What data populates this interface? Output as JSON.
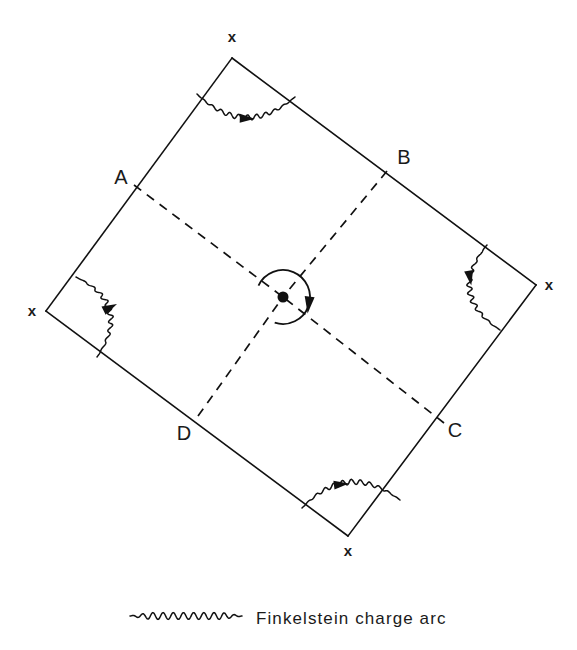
{
  "figure": {
    "background_color": "#ffffff",
    "line_color": "#111111"
  },
  "square": {
    "description": "Tilted square (diamond) with four vertices marked x",
    "vertices": [
      {
        "id": "top",
        "label": "x",
        "x": 232,
        "y": 58,
        "label_x": 232,
        "label_y": 42
      },
      {
        "id": "right",
        "label": "x",
        "x": 536,
        "y": 285,
        "label_x": 549,
        "label_y": 290
      },
      {
        "id": "bottom",
        "label": "x",
        "x": 348,
        "y": 536,
        "label_x": 348,
        "label_y": 556
      },
      {
        "id": "left",
        "label": "x",
        "x": 46,
        "y": 311,
        "label_x": 32,
        "label_y": 316
      }
    ]
  },
  "corner_points": [
    {
      "id": "A",
      "label": "A",
      "x": 134,
      "y": 185,
      "label_x": 121,
      "label_y": 184
    },
    {
      "id": "B",
      "label": "B",
      "x": 387,
      "y": 171,
      "label_x": 404,
      "label_y": 164
    },
    {
      "id": "C",
      "label": "C",
      "x": 444,
      "y": 423,
      "label_x": 455,
      "label_y": 437
    },
    {
      "id": "D",
      "label": "D",
      "x": 198,
      "y": 416,
      "label_x": 184,
      "label_y": 440
    }
  ],
  "center": {
    "id": "center-spin",
    "x": 283,
    "y": 297,
    "dot_radius": 5.5,
    "circle_radius": 27,
    "rotation": "clockwise",
    "arrow_direction": "down"
  },
  "charge_arcs": [
    {
      "id": "arc-top",
      "vertex": "top",
      "arrow_direction": "right"
    },
    {
      "id": "arc-right",
      "vertex": "right",
      "arrow_direction": "down"
    },
    {
      "id": "arc-bottom",
      "vertex": "bottom",
      "arrow_direction": "right"
    },
    {
      "id": "arc-left",
      "vertex": "left",
      "arrow_direction": "up-right"
    }
  ],
  "legend": {
    "sample_label": "wavy-line-sample",
    "text": "Finkelstein charge arc",
    "sample_x1": 130,
    "sample_x2": 242,
    "sample_y": 616,
    "text_x": 256,
    "text_y": 624
  }
}
